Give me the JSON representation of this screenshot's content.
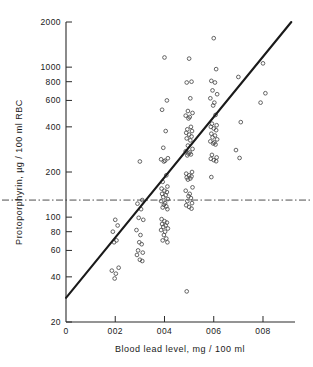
{
  "chart_data": {
    "type": "scatter",
    "title": "",
    "xlabel": "Blood lead level, mg / 100 ml",
    "ylabel": "Protoporphyrin, µg / 100 ml RBC",
    "xlim": [
      0,
      0.093
    ],
    "ylim": [
      20,
      2000
    ],
    "yscale": "log",
    "xscale": "linear",
    "grid": false,
    "legend": null,
    "xticks": [
      0,
      0.02,
      0.04,
      0.06,
      0.08
    ],
    "xtick_labels": [
      "0",
      "002",
      "004",
      "006",
      "008"
    ],
    "yticks": [
      20,
      40,
      60,
      80,
      100,
      200,
      400,
      600,
      800,
      1000,
      2000
    ],
    "ytick_labels": [
      "20",
      "40",
      "60",
      "80",
      "100",
      "200",
      "400",
      "600",
      "800",
      "1000",
      "2000"
    ],
    "reference_line": {
      "orientation": "horizontal",
      "value": 130,
      "style": "dash-dot",
      "label": ""
    },
    "regression_line": {
      "x_start": 0.0,
      "y_start": 29,
      "x_end": 0.0915,
      "y_end": 2000
    },
    "series": [
      {
        "name": "observations",
        "marker": "open-circle",
        "points": [
          [
            0.02,
            96
          ],
          [
            0.02,
            88
          ],
          [
            0.02,
            80
          ],
          [
            0.02,
            70
          ],
          [
            0.02,
            68
          ],
          [
            0.02,
            46
          ],
          [
            0.02,
            44
          ],
          [
            0.02,
            42
          ],
          [
            0.02,
            39
          ],
          [
            0.03,
            235
          ],
          [
            0.03,
            130
          ],
          [
            0.03,
            123
          ],
          [
            0.03,
            113
          ],
          [
            0.03,
            99
          ],
          [
            0.03,
            96
          ],
          [
            0.03,
            82
          ],
          [
            0.03,
            76
          ],
          [
            0.03,
            68
          ],
          [
            0.03,
            66
          ],
          [
            0.03,
            60
          ],
          [
            0.03,
            58
          ],
          [
            0.03,
            56
          ],
          [
            0.03,
            52
          ],
          [
            0.03,
            51
          ],
          [
            0.04,
            1160
          ],
          [
            0.04,
            600
          ],
          [
            0.04,
            520
          ],
          [
            0.04,
            375
          ],
          [
            0.04,
            290
          ],
          [
            0.04,
            247
          ],
          [
            0.04,
            243
          ],
          [
            0.04,
            238
          ],
          [
            0.04,
            235
          ],
          [
            0.04,
            190
          ],
          [
            0.04,
            172
          ],
          [
            0.04,
            160
          ],
          [
            0.04,
            155
          ],
          [
            0.04,
            150
          ],
          [
            0.04,
            147
          ],
          [
            0.04,
            143
          ],
          [
            0.04,
            140
          ],
          [
            0.04,
            136
          ],
          [
            0.04,
            132
          ],
          [
            0.04,
            128
          ],
          [
            0.04,
            124
          ],
          [
            0.04,
            121
          ],
          [
            0.04,
            118
          ],
          [
            0.04,
            116
          ],
          [
            0.04,
            113
          ],
          [
            0.04,
            97
          ],
          [
            0.04,
            94
          ],
          [
            0.04,
            92
          ],
          [
            0.04,
            90
          ],
          [
            0.04,
            88
          ],
          [
            0.04,
            86
          ],
          [
            0.04,
            84
          ],
          [
            0.04,
            82
          ],
          [
            0.04,
            80
          ],
          [
            0.04,
            76
          ],
          [
            0.04,
            72
          ],
          [
            0.04,
            70
          ],
          [
            0.04,
            68
          ],
          [
            0.05,
            1140
          ],
          [
            0.05,
            800
          ],
          [
            0.05,
            790
          ],
          [
            0.05,
            620
          ],
          [
            0.05,
            510
          ],
          [
            0.05,
            495
          ],
          [
            0.05,
            475
          ],
          [
            0.05,
            465
          ],
          [
            0.05,
            455
          ],
          [
            0.05,
            400
          ],
          [
            0.05,
            385
          ],
          [
            0.05,
            375
          ],
          [
            0.05,
            365
          ],
          [
            0.05,
            355
          ],
          [
            0.05,
            345
          ],
          [
            0.05,
            335
          ],
          [
            0.05,
            325
          ],
          [
            0.05,
            300
          ],
          [
            0.05,
            285
          ],
          [
            0.05,
            275
          ],
          [
            0.05,
            270
          ],
          [
            0.05,
            265
          ],
          [
            0.05,
            262
          ],
          [
            0.05,
            258
          ],
          [
            0.05,
            200
          ],
          [
            0.05,
            195
          ],
          [
            0.05,
            190
          ],
          [
            0.05,
            187
          ],
          [
            0.05,
            184
          ],
          [
            0.05,
            181
          ],
          [
            0.05,
            178
          ],
          [
            0.05,
            158
          ],
          [
            0.05,
            150
          ],
          [
            0.05,
            143
          ],
          [
            0.05,
            138
          ],
          [
            0.05,
            134
          ],
          [
            0.05,
            128
          ],
          [
            0.05,
            124
          ],
          [
            0.05,
            120
          ],
          [
            0.05,
            117
          ],
          [
            0.05,
            114
          ],
          [
            0.05,
            32
          ],
          [
            0.06,
            1560
          ],
          [
            0.06,
            970
          ],
          [
            0.06,
            810
          ],
          [
            0.06,
            790
          ],
          [
            0.06,
            700
          ],
          [
            0.06,
            660
          ],
          [
            0.06,
            620
          ],
          [
            0.06,
            580
          ],
          [
            0.06,
            555
          ],
          [
            0.06,
            480
          ],
          [
            0.06,
            420
          ],
          [
            0.06,
            410
          ],
          [
            0.06,
            400
          ],
          [
            0.06,
            390
          ],
          [
            0.06,
            380
          ],
          [
            0.06,
            360
          ],
          [
            0.06,
            350
          ],
          [
            0.06,
            340
          ],
          [
            0.06,
            330
          ],
          [
            0.06,
            320
          ],
          [
            0.06,
            315
          ],
          [
            0.06,
            310
          ],
          [
            0.06,
            305
          ],
          [
            0.06,
            260
          ],
          [
            0.06,
            250
          ],
          [
            0.06,
            245
          ],
          [
            0.06,
            240
          ],
          [
            0.06,
            236
          ],
          [
            0.06,
            185
          ],
          [
            0.07,
            860
          ],
          [
            0.07,
            430
          ],
          [
            0.07,
            280
          ],
          [
            0.07,
            248
          ],
          [
            0.08,
            1060
          ],
          [
            0.08,
            670
          ],
          [
            0.08,
            580
          ]
        ]
      }
    ]
  },
  "axis_titles": {
    "x": "Blood  lead  level,   mg / 100 ml",
    "y": "Protoporphyrin,  µg / 100 ml RBC"
  }
}
